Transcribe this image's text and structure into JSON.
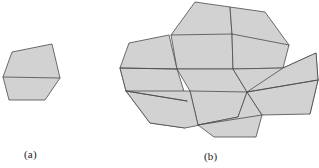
{
  "figure": {
    "background_color": "#ffffff",
    "fill_color": "#d2d2d2",
    "stroke_color": "#4a4a4a",
    "stroke_width": 0.8,
    "panels": [
      {
        "id": "a",
        "caption": "(a)",
        "description": "single pentagon tile",
        "tile_count": 1
      },
      {
        "id": "b",
        "caption": "(b)",
        "description": "tiling made of congruent pentagon tiles",
        "tile_count": 9
      }
    ]
  },
  "chart_data": {
    "type": "diagram",
    "prototile": {
      "name": "pentagon",
      "vertices": [
        [
          3,
          77
        ],
        [
          12,
          52
        ],
        [
          52,
          44
        ],
        [
          60,
          78
        ],
        [
          45,
          100
        ],
        [
          9,
          100
        ]
      ],
      "interior_edges": [
        [
          [
            3,
            77
          ],
          [
            60,
            78
          ]
        ]
      ]
    },
    "panel_a": {
      "caption": "(a)",
      "caption_position": [
        24,
        148
      ],
      "tiles": [
        {
          "id": "a1",
          "outline": [
            [
              3,
              77
            ],
            [
              12,
              52
            ],
            [
              52,
              44
            ],
            [
              60,
              78
            ],
            [
              45,
              100
            ],
            [
              9,
              100
            ]
          ],
          "chord": [
            [
              3,
              77
            ],
            [
              60,
              78
            ]
          ]
        }
      ]
    },
    "panel_b": {
      "caption": "(b)",
      "caption_position": [
        204,
        150
      ],
      "tiles": [
        {
          "id": "b1",
          "outline": [
            [
              120,
              68
            ],
            [
              129,
              43
            ],
            [
              169,
              35
            ],
            [
              177,
              69
            ],
            [
              162,
              91
            ],
            [
              126,
              91
            ]
          ],
          "chord": [
            [
              120,
              68
            ],
            [
              177,
              69
            ]
          ]
        },
        {
          "id": "b2",
          "outline": [
            [
              177,
              69
            ],
            [
              171,
              35
            ],
            [
              195,
              2
            ],
            [
              230,
              7
            ],
            [
              232,
              34
            ],
            [
              233,
              69
            ]
          ],
          "chord": [
            [
              171,
              35
            ],
            [
              232,
              34
            ]
          ]
        },
        {
          "id": "b3",
          "outline": [
            [
              177,
              69
            ],
            [
              233,
              69
            ],
            [
              247,
              92
            ],
            [
              238,
              117
            ],
            [
              198,
              125
            ],
            [
              190,
              91
            ]
          ],
          "chord": [
            [
              190,
              91
            ],
            [
              247,
              92
            ]
          ]
        },
        {
          "id": "b4",
          "outline": [
            [
              120,
              68
            ],
            [
              126,
              91
            ],
            [
              150,
              123
            ],
            [
              185,
              128
            ],
            [
              187,
              101
            ],
            [
              177,
              69
            ]
          ],
          "chord": [
            [
              126,
              91
            ],
            [
              187,
              101
            ]
          ]
        },
        {
          "id": "b5",
          "outline": [
            [
              232,
              34
            ],
            [
              230,
              7
            ],
            [
              265,
              12
            ],
            [
              289,
              45
            ],
            [
              283,
              68
            ],
            [
              233,
              69
            ]
          ],
          "chord": [
            [
              232,
              34
            ],
            [
              289,
              45
            ]
          ]
        },
        {
          "id": "b6",
          "outline": [
            [
              233,
              69
            ],
            [
              283,
              68
            ],
            [
              316,
              53
            ],
            [
              318,
              80
            ],
            [
              310,
              114
            ],
            [
              247,
              92
            ]
          ],
          "chord": [
            [
              247,
              92
            ],
            [
              318,
              80
            ]
          ]
        },
        {
          "id": "b7",
          "outline": [
            [
              150,
              123
            ],
            [
              185,
              128
            ],
            [
              200,
              125
            ],
            [
              198,
              125
            ],
            [
              190,
              91
            ],
            [
              126,
              91
            ]
          ],
          "chord": [
            [
              126,
              91
            ],
            [
              187,
              101
            ]
          ]
        },
        {
          "id": "b8",
          "outline": [
            [
              198,
              125
            ],
            [
              238,
              117
            ],
            [
              247,
              92
            ],
            [
              262,
              115
            ],
            [
              256,
              137
            ],
            [
              214,
              137
            ]
          ],
          "chord": [
            [
              198,
              125
            ],
            [
              262,
              115
            ]
          ]
        },
        {
          "id": "b9",
          "outline": [
            [
              283,
              68
            ],
            [
              316,
              53
            ],
            [
              318,
              80
            ],
            [
              310,
              114
            ],
            [
              262,
              115
            ],
            [
              247,
              92
            ]
          ],
          "chord": [
            [
              247,
              92
            ],
            [
              318,
              80
            ]
          ]
        }
      ]
    }
  }
}
